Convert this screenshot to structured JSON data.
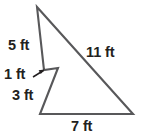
{
  "figure": {
    "type": "polygon-with-notch",
    "units": "ft",
    "outline_color": "#58585a",
    "label_color": "#231f20",
    "background_color": "#ffffff",
    "vertices": [
      {
        "name": "apex-top",
        "x": 37,
        "y": 7
      },
      {
        "name": "bottom-right",
        "x": 133,
        "y": 114
      },
      {
        "name": "bottom-left",
        "x": 40,
        "y": 114
      },
      {
        "name": "notch-outer",
        "x": 58,
        "y": 68
      },
      {
        "name": "notch-inner",
        "x": 44,
        "y": 70
      }
    ],
    "sides": [
      {
        "name": "side-5ft",
        "label": "5 ft",
        "value": 5,
        "from": "apex-top",
        "to": "notch-inner"
      },
      {
        "name": "side-1ft",
        "label": "1 ft",
        "value": 1,
        "from": "notch-inner",
        "to": "notch-outer"
      },
      {
        "name": "side-3ft",
        "label": "3 ft",
        "value": 3,
        "from": "notch-outer",
        "to": "bottom-left"
      },
      {
        "name": "side-7ft",
        "label": "7 ft",
        "value": 7,
        "from": "bottom-left",
        "to": "bottom-right"
      },
      {
        "name": "side-11ft",
        "label": "11 ft",
        "value": 11,
        "from": "bottom-right",
        "to": "apex-top"
      }
    ],
    "leader": {
      "name": "one-ft-leader-arrow",
      "points_to": "notch-inner",
      "direction": "up-right"
    }
  }
}
